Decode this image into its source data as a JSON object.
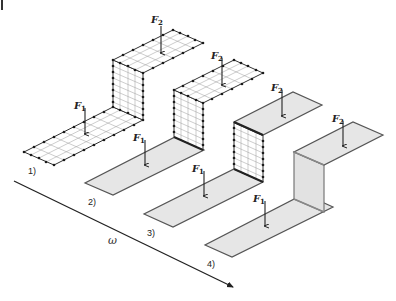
{
  "figure": {
    "axis": {
      "label": "ω",
      "arrow_color": "#222222"
    },
    "colors": {
      "plate_fill": "#e6e6e6",
      "mesh_fill": "#ffffff",
      "edge": "#555555",
      "node": "#1a1a1a",
      "grid": "#9a9a9a"
    },
    "shapes": [
      {
        "id": 1,
        "label": "1)",
        "style": "full-mesh",
        "forces": {
          "f1": "F",
          "f1_sub": "1",
          "f2": "F",
          "f2_sub": "2"
        }
      },
      {
        "id": 2,
        "label": "2)",
        "style": "mesh-wall-and-top",
        "forces": {
          "f1": "F",
          "f1_sub": "1",
          "f2": "F",
          "f2_sub": "2"
        }
      },
      {
        "id": 3,
        "label": "3)",
        "style": "mesh-wall-only",
        "forces": {
          "f1": "F",
          "f1_sub": "1",
          "f2": "F",
          "f2_sub": "2"
        }
      },
      {
        "id": 4,
        "label": "4)",
        "style": "continuous",
        "forces": {
          "f1": "F",
          "f1_sub": "1",
          "f2": "F",
          "f2_sub": "2"
        }
      }
    ]
  }
}
